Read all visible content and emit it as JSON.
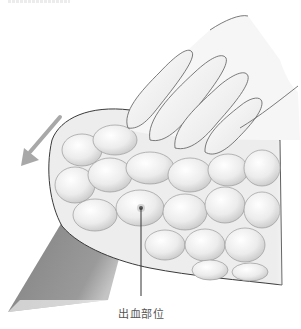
{
  "figure": {
    "annotations": [
      {
        "id": "bleeding-site",
        "label": "出血部位",
        "point": [
          141,
          208
        ],
        "leader_end": [
          141,
          296
        ]
      }
    ],
    "arrow": {
      "direction": "down-left",
      "color": "#a8a8a8"
    },
    "colors": {
      "outline": "#3a3a3a",
      "tissue_light": "#f2f2f2",
      "tissue_shadow": "#c9c9c9",
      "vessel": "#8a8a8a",
      "point": "#555555"
    }
  }
}
